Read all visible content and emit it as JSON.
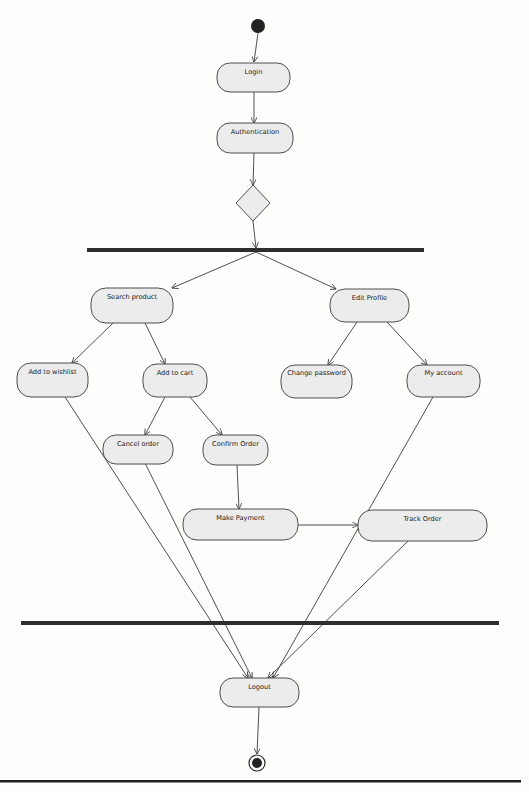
{
  "diagram": {
    "type": "UML activity diagram",
    "nodes": {
      "login": {
        "label": "Login"
      },
      "authentication": {
        "label": "Authentication"
      },
      "search_product": {
        "label": "Search product"
      },
      "edit_profile": {
        "label": "Edit Profile"
      },
      "add_to_wishlist": {
        "label": "Add to wishlist"
      },
      "add_to_cart": {
        "label": "Add to cart"
      },
      "change_password": {
        "label": "Change password"
      },
      "my_account": {
        "label": "My account"
      },
      "cancel_order": {
        "label": "Cancel order"
      },
      "confirm_order": {
        "label": "Confirm Order"
      },
      "make_payment": {
        "label": "Make Payment"
      },
      "track_order": {
        "label": "Track Order"
      },
      "logout": {
        "label": "Logout"
      }
    },
    "special_nodes": [
      "initial-node",
      "decision-node",
      "fork-bar",
      "join-bar",
      "final-node"
    ],
    "edges": [
      [
        "initial-node",
        "Login"
      ],
      [
        "Login",
        "Authentication"
      ],
      [
        "Authentication",
        "decision-node"
      ],
      [
        "decision-node",
        "fork-bar"
      ],
      [
        "fork-bar",
        "Search product"
      ],
      [
        "fork-bar",
        "Edit Profile"
      ],
      [
        "Search product",
        "Add to wishlist"
      ],
      [
        "Search product",
        "Add to cart"
      ],
      [
        "Add to cart",
        "Cancel order"
      ],
      [
        "Add to cart",
        "Confirm Order"
      ],
      [
        "Edit Profile",
        "Change password"
      ],
      [
        "Edit Profile",
        "My account"
      ],
      [
        "Confirm Order",
        "Make Payment"
      ],
      [
        "Make Payment",
        "Track Order"
      ],
      [
        "Add to wishlist",
        "Logout"
      ],
      [
        "Cancel order",
        "Logout"
      ],
      [
        "Track Order",
        "Logout"
      ],
      [
        "My account",
        "Logout"
      ],
      [
        "Logout",
        "final-node"
      ]
    ],
    "colors": {
      "node_fill": "#ececec",
      "node_stroke": "#4e4e4e",
      "bar": "#2e2e2e",
      "edge": "#3c3c3c"
    }
  }
}
